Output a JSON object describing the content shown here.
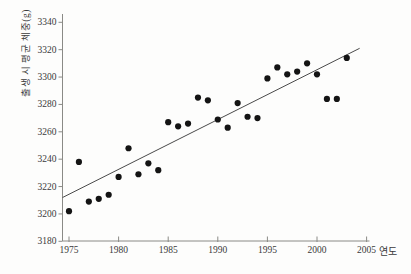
{
  "chart_data": {
    "type": "scatter",
    "title": "",
    "xlabel": "연도",
    "ylabel": "출생 시 평균 체중(g)",
    "x": [
      1975,
      1976,
      1977,
      1978,
      1979,
      1980,
      1981,
      1982,
      1983,
      1984,
      1985,
      1986,
      1987,
      1988,
      1989,
      1990,
      1991,
      1992,
      1993,
      1994,
      1995,
      1996,
      1997,
      1998,
      1999,
      2000,
      2001,
      2002,
      2003
    ],
    "y": [
      3202,
      3238,
      3209,
      3211,
      3214,
      3227,
      3248,
      3229,
      3237,
      3232,
      3267,
      3264,
      3266,
      3285,
      3283,
      3269,
      3263,
      3281,
      3271,
      3270,
      3299,
      3307,
      3302,
      3304,
      3310,
      3302,
      3284,
      3284,
      3314
    ],
    "x_ticks": [
      1975,
      1980,
      1985,
      1990,
      1995,
      2000,
      2005
    ],
    "y_ticks": [
      3180,
      3200,
      3220,
      3240,
      3260,
      3280,
      3300,
      3320,
      3340
    ],
    "xlim": [
      1974.3,
      2005.6
    ],
    "ylim": [
      3180,
      3340
    ],
    "grid": false,
    "legend": "none",
    "trend_line": {
      "x1": 1974.35,
      "y1": 3212,
      "x2": 2004.3,
      "y2": 3321
    },
    "colors": {
      "point": "#141414",
      "trend": "#4a4a4a",
      "axis": "#8a8a86",
      "tick_text": "#3a3a3a",
      "background": "#fdfdfc"
    }
  }
}
